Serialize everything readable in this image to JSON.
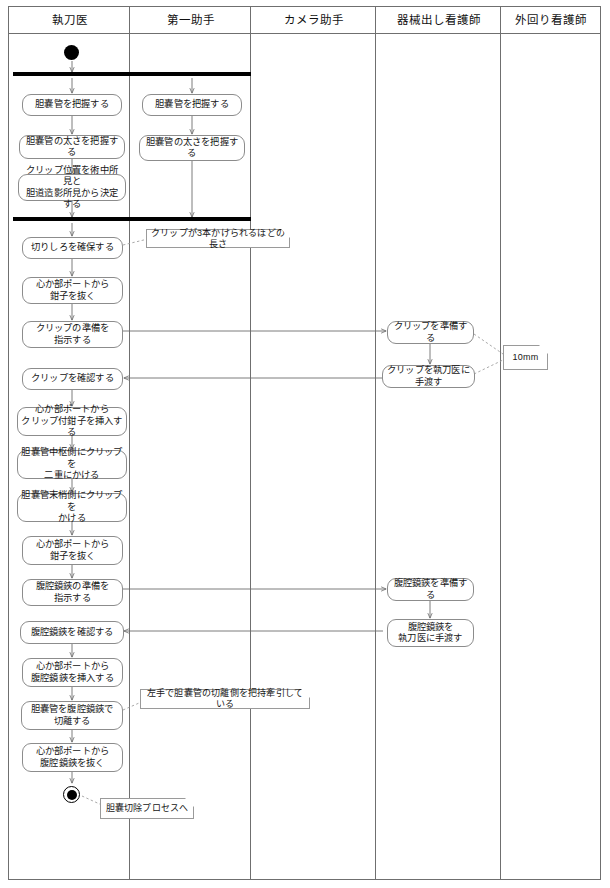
{
  "diagram": {
    "kind": "uml-activity-swimlane",
    "title_present": false,
    "lanes": [
      {
        "id": "surgeon",
        "label": "執刀医"
      },
      {
        "id": "first-assistant",
        "label": "第一助手"
      },
      {
        "id": "camera-assistant",
        "label": "カメラ助手"
      },
      {
        "id": "scrub-nurse",
        "label": "器械出し看護師"
      },
      {
        "id": "circulating-nurse",
        "label": "外回り看護師"
      }
    ],
    "nodes": {
      "surgeon": [
        {
          "key": "s1",
          "lines": [
            "胆嚢管を把握する"
          ]
        },
        {
          "key": "s2",
          "lines": [
            "胆嚢管の太さを把握する"
          ]
        },
        {
          "key": "s3",
          "lines": [
            "クリップ位置を術中所見と",
            "胆道造影所見から決定する"
          ]
        },
        {
          "key": "s4",
          "lines": [
            "切りしろを確保する"
          ]
        },
        {
          "key": "s5",
          "lines": [
            "心か部ポートから",
            "鉗子を抜く"
          ]
        },
        {
          "key": "s6",
          "lines": [
            "クリップの準備を",
            "指示する"
          ]
        },
        {
          "key": "s7",
          "lines": [
            "クリップを確認する"
          ]
        },
        {
          "key": "s8",
          "lines": [
            "心か部ポートから",
            "クリップ付鉗子を挿入する"
          ]
        },
        {
          "key": "s9",
          "lines": [
            "胆嚢管中枢側にクリップを",
            "二重にかける"
          ]
        },
        {
          "key": "s10",
          "lines": [
            "胆嚢管末梢側にクリップを",
            "かける"
          ]
        },
        {
          "key": "s11",
          "lines": [
            "心か部ポートから",
            "鉗子を抜く"
          ]
        },
        {
          "key": "s12",
          "lines": [
            "腹腔鏡鋏の準備を",
            "指示する"
          ]
        },
        {
          "key": "s13",
          "lines": [
            "腹腔鏡鋏を確認する"
          ]
        },
        {
          "key": "s14",
          "lines": [
            "心か部ポートから",
            "腹腔鏡鋏を挿入する"
          ]
        },
        {
          "key": "s15",
          "lines": [
            "胆嚢管を腹腔鏡鋏で",
            "切離する"
          ]
        },
        {
          "key": "s16",
          "lines": [
            "心か部ポートから",
            "腹腔鏡鋏を抜く"
          ]
        }
      ],
      "first-assistant": [
        {
          "key": "a1",
          "lines": [
            "胆嚢管を把握する"
          ]
        },
        {
          "key": "a2",
          "lines": [
            "胆嚢管の太さを把握する"
          ]
        }
      ],
      "camera-assistant": [],
      "scrub-nurse": [
        {
          "key": "n1",
          "lines": [
            "クリップを準備する"
          ]
        },
        {
          "key": "n2",
          "lines": [
            "クリップを執刀医に手渡す"
          ]
        },
        {
          "key": "n3",
          "lines": [
            "腹腔鏡鋏を準備する"
          ]
        },
        {
          "key": "n4",
          "lines": [
            "腹腔鏡鋏を",
            "執刀医に手渡す"
          ]
        }
      ],
      "circulating-nurse": []
    },
    "notes": [
      {
        "key": "note1",
        "lines": [
          "クリップが3本かけられるほどの長さ"
        ],
        "attaches_to": "切りしろを確保する"
      },
      {
        "key": "note2",
        "lines": [
          "10mm"
        ],
        "attaches_to": "クリップを準備する"
      },
      {
        "key": "note3",
        "lines": [
          "左手で胆嚢管の切離側を把持牽引している"
        ],
        "attaches_to": "胆嚢管を腹腔鏡鋏で切離する"
      },
      {
        "key": "note4",
        "lines": [
          "胆嚢切除プロセスへ"
        ],
        "attaches_to": "end-node"
      }
    ],
    "control_nodes": [
      {
        "key": "start",
        "type": "initial-node",
        "lane": "surgeon"
      },
      {
        "key": "fork1",
        "type": "fork-bar",
        "spans": [
          "surgeon",
          "first-assistant"
        ]
      },
      {
        "key": "join1",
        "type": "join-bar",
        "spans": [
          "surgeon",
          "first-assistant"
        ]
      },
      {
        "key": "end",
        "type": "final-node",
        "lane": "surgeon"
      }
    ],
    "colors": {
      "frame": "#6f6f6f",
      "node_border": "#8c8c8c",
      "note_border": "#9a9a9a",
      "bar": "#000000",
      "flow": "#6e6e6e",
      "background": "#ffffff",
      "text": "#161616"
    }
  }
}
